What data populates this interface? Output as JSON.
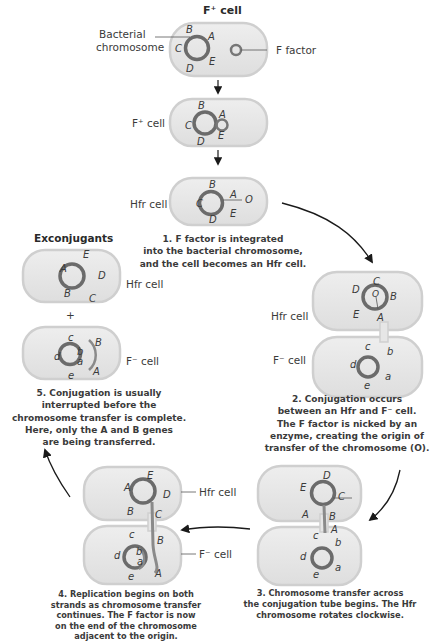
{
  "diagram": {
    "title_top": "F⁺ cell",
    "labels": {
      "bacterial_chromosome_1": "Bacterial",
      "bacterial_chromosome_2": "chromosome",
      "f_factor": "F factor",
      "fplus_cell": "F⁺ cell",
      "hfr_cell": "Hfr cell",
      "fminus_cell": "F⁻ cell",
      "exconjugants": "Exconjugants",
      "plus": "+",
      "origin": "O"
    },
    "genes_upper": [
      "A",
      "B",
      "C",
      "D",
      "E"
    ],
    "genes_lower": [
      "a",
      "b",
      "c",
      "d",
      "e"
    ],
    "steps": [
      {
        "number": 1,
        "lines": [
          "1. F factor is integrated",
          "into the bacterial chromosome,",
          "and the cell becomes an Hfr cell."
        ]
      },
      {
        "number": 2,
        "lines": [
          "2. Conjugation occurs",
          "between an Hfr and F⁻ cell.",
          "The F factor is nicked by an",
          "enzyme, creating the origin of",
          "transfer of the chromosome (O)."
        ]
      },
      {
        "number": 3,
        "lines": [
          "3. Chromosome transfer across",
          "the conjugation tube begins. The Hfr",
          "chromosome rotates clockwise."
        ]
      },
      {
        "number": 4,
        "lines": [
          "4. Replication begins on both",
          "strands as chromosome transfer",
          "continues. The F factor is now",
          "on the end of the chromosome",
          "adjacent to the origin."
        ]
      },
      {
        "number": 5,
        "lines": [
          "5. Conjugation is usually",
          "interrupted before the",
          "chromosome transfer is complete.",
          "Here, only the A and B genes",
          "are being transferred."
        ]
      }
    ],
    "colors": {
      "cell_fill": "#e6e6e6",
      "cell_outline": "#c8c8c8",
      "chromosome": "#6b6b6b",
      "chromosome_highlight": "#9a9a9a",
      "text": "#3a3a3a",
      "arrow": "#1a1a1a"
    }
  }
}
